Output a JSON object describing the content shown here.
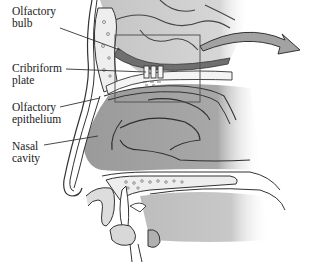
{
  "diagram": {
    "type": "anatomical-sagittal-section",
    "labels": [
      {
        "id": "olfactory-bulb",
        "text": "Olfactory\nbulb",
        "x": 12,
        "y": 5
      },
      {
        "id": "cribriform-plate",
        "text": "Cribriform\nplate",
        "x": 12,
        "y": 62
      },
      {
        "id": "olfactory-epithelium",
        "text": "Olfactory\nepithelium",
        "x": 12,
        "y": 101
      },
      {
        "id": "nasal-cavity",
        "text": "Nasal\ncavity",
        "x": 12,
        "y": 140
      }
    ],
    "colors": {
      "background": "#ffffff",
      "tissue_dark": "#8f8f8f",
      "tissue_mid": "#b5b5b5",
      "tissue_light": "#dcdcdc",
      "bone": "#ececec",
      "outline": "#333333",
      "arrow_fill": "#9a9a9a"
    }
  }
}
